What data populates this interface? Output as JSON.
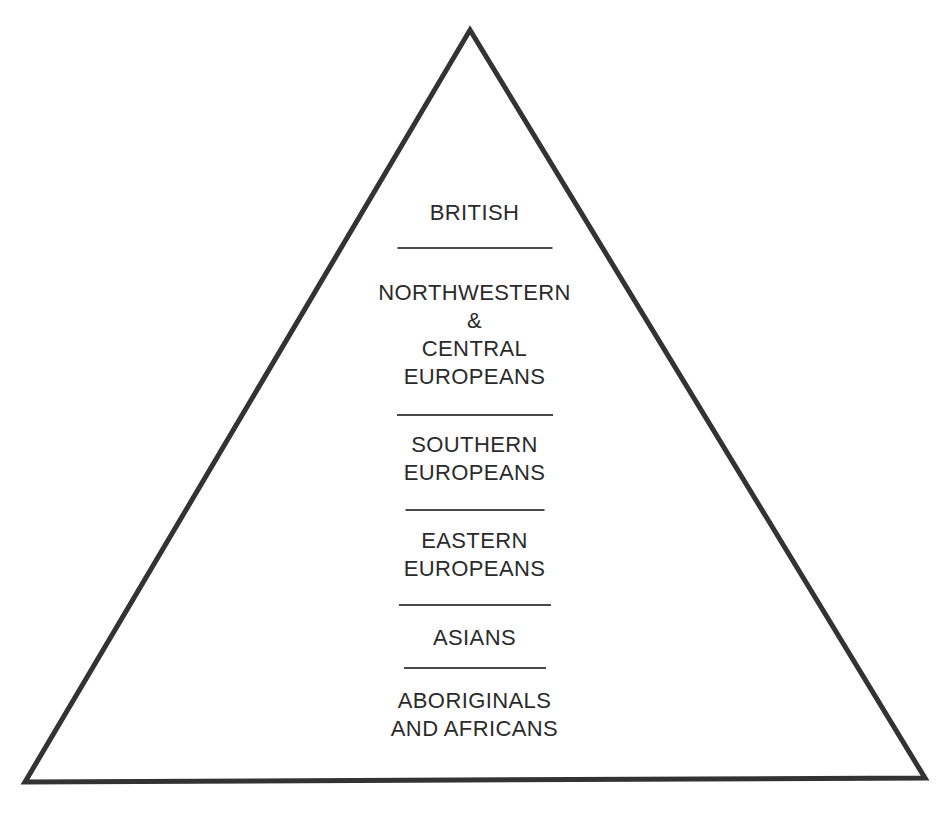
{
  "diagram": {
    "type": "pyramid",
    "shape": {
      "apex_x": 470,
      "apex_y": 30,
      "bottom_left_x": 25,
      "bottom_left_y": 782,
      "bottom_right_x": 925,
      "bottom_right_y": 778,
      "stroke_color": "#333333",
      "stroke_width": 5,
      "fill_color": "#ffffff"
    },
    "text_color": "#2b2b2b",
    "divider_color": "#4a4a4a",
    "background_color": "#ffffff",
    "tiers": [
      {
        "rank": 1,
        "label": "BRITISH"
      },
      {
        "rank": 2,
        "label": "NORTHWESTERN\n&\nCENTRAL\nEUROPEANS"
      },
      {
        "rank": 3,
        "label": "SOUTHERN\nEUROPEANS"
      },
      {
        "rank": 4,
        "label": "EASTERN\nEUROPEANS"
      },
      {
        "rank": 5,
        "label": "ASIANS"
      },
      {
        "rank": 6,
        "label": "ABORIGINALS\nAND AFRICANS"
      }
    ]
  }
}
